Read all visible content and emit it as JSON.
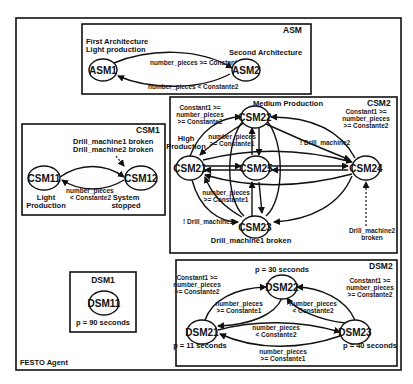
{
  "agent": {
    "label": "FESTO Agent"
  },
  "asm": {
    "title": "ASM",
    "first_arch_line1": "First Architecture",
    "first_arch_line2": "Light production",
    "second_arch": "Second Architecture",
    "nodes": [
      "ASM1",
      "ASM2"
    ],
    "edge_top": "number_pieces >= Constante2",
    "edge_bottom": "number_pieces < Constante2"
  },
  "csm1": {
    "title": "CSM1",
    "nodes": [
      "CSM11",
      "CSM12"
    ],
    "trigger_line1": "Drill_machine1 broken",
    "trigger_line2": "Drill_machine2 broken",
    "edge_line1": "number_pieces",
    "edge_line2": "< Constante2",
    "node11_label_line1": "Light",
    "node11_label_line2": "Production",
    "node12_label_line1": "System",
    "node12_label_line2": "stopped"
  },
  "csm2": {
    "title": "CSM2",
    "medium_production": "Medium Production",
    "high_line1": "High",
    "high_line2": "Production",
    "nodes": [
      "CSM21",
      "CSM22",
      "CSM23",
      "CSM24",
      "CSM25"
    ],
    "left_cond_line1": "Constant1 >=",
    "left_cond_line2": "number_pieces",
    "left_cond_line3": ">= Constante2",
    "right_cond_line1": "Constant1 >=",
    "right_cond_line2": "number_pieces",
    "right_cond_line3": ">= Constante2",
    "upper_cond_line1": "number_pieces",
    "upper_cond_line2": ">= Constante1",
    "lower_cond_line1": "number_pieces",
    "lower_cond_line2": ">= Constante1",
    "not_drill2": "! Drill_machine2",
    "not_drill1": "! Drill_machine1",
    "drill1_broken": "Drill_machine1 broken",
    "drill2_broken_line1": "Drill_machine2",
    "drill2_broken_line2": "broken"
  },
  "dsm1": {
    "title": "DSM1",
    "node": "DSM11",
    "period": "p = 90 seconds"
  },
  "dsm2": {
    "title": "DSM2",
    "nodes": [
      "DSM21",
      "DSM22",
      "DSM23"
    ],
    "period_22": "p = 30 seconds",
    "period_21": "p = 11 seconds",
    "period_23": "p = 40 seconds",
    "left_cond_line1": "Constant1 >=",
    "left_cond_line2": "number_pieces",
    "left_cond_line3": ">= Constante2",
    "right_cond_line1": "Constant1 >=",
    "right_cond_line2": "number_pieces",
    "right_cond_line3": ">= Constante2",
    "inner_left_line1": "number_pieces",
    "inner_left_line2": ">= Constante1",
    "inner_right_line1": "number_pieces",
    "inner_right_line2": "< Constante2",
    "mid_line1": "number_pieces",
    "mid_line2": "< Constante2",
    "bottom_line1": "number_pieces",
    "bottom_line2": ">= Constante1"
  }
}
